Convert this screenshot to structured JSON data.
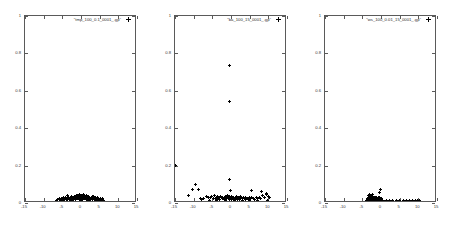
{
  "figure": {
    "background": "#ffffff",
    "marker_color": "#000000",
    "axis_color": "#5a5a5a",
    "panel_count": 3
  },
  "chart_data": [
    {
      "type": "scatter",
      "title": "\"tmp_100_0.1_0001_.gp\"",
      "legend": [
        "\"tmp_100_0.1_0001_.gp\""
      ],
      "legend_position": "top-right inside",
      "xlabel": "",
      "ylabel": "",
      "xlim": [
        -15,
        15
      ],
      "ylim": [
        0,
        1
      ],
      "xticks": [
        -15,
        -10,
        -5,
        0,
        5,
        10,
        15
      ],
      "yticks": [
        0,
        0.2,
        0.4,
        0.6,
        0.8,
        1
      ],
      "grid": false,
      "marker": "plus",
      "points": [
        [
          -6.2,
          0.018
        ],
        [
          -5.8,
          0.022
        ],
        [
          -5.5,
          0.016
        ],
        [
          -5.2,
          0.025
        ],
        [
          -5.0,
          0.019
        ],
        [
          -4.8,
          0.028
        ],
        [
          -4.6,
          0.021
        ],
        [
          -4.4,
          0.017
        ],
        [
          -4.2,
          0.03
        ],
        [
          -4.0,
          0.023
        ],
        [
          -3.9,
          0.018
        ],
        [
          -3.7,
          0.026
        ],
        [
          -3.5,
          0.02
        ],
        [
          -3.4,
          0.032
        ],
        [
          -3.2,
          0.024
        ],
        [
          -3.1,
          0.019
        ],
        [
          -2.9,
          0.028
        ],
        [
          -2.8,
          0.022
        ],
        [
          -2.6,
          0.035
        ],
        [
          -2.5,
          0.026
        ],
        [
          -2.3,
          0.02
        ],
        [
          -2.2,
          0.03
        ],
        [
          -2.0,
          0.024
        ],
        [
          -1.9,
          0.018
        ],
        [
          -1.8,
          0.033
        ],
        [
          -1.6,
          0.027
        ],
        [
          -1.5,
          0.021
        ],
        [
          -1.3,
          0.036
        ],
        [
          -1.2,
          0.029
        ],
        [
          -1.0,
          0.023
        ],
        [
          -0.9,
          0.038
        ],
        [
          -0.8,
          0.031
        ],
        [
          -0.6,
          0.025
        ],
        [
          -0.5,
          0.019
        ],
        [
          -0.4,
          0.034
        ],
        [
          -0.2,
          0.028
        ],
        [
          -0.1,
          0.022
        ],
        [
          0.0,
          0.04
        ],
        [
          0.1,
          0.032
        ],
        [
          0.3,
          0.026
        ],
        [
          0.4,
          0.02
        ],
        [
          0.6,
          0.035
        ],
        [
          0.7,
          0.029
        ],
        [
          0.9,
          0.023
        ],
        [
          1.0,
          0.038
        ],
        [
          1.2,
          0.031
        ],
        [
          1.3,
          0.025
        ],
        [
          1.5,
          0.019
        ],
        [
          1.6,
          0.033
        ],
        [
          1.8,
          0.027
        ],
        [
          1.9,
          0.021
        ],
        [
          2.1,
          0.036
        ],
        [
          2.2,
          0.03
        ],
        [
          2.4,
          0.024
        ],
        [
          2.5,
          0.018
        ],
        [
          2.7,
          0.032
        ],
        [
          2.9,
          0.026
        ],
        [
          3.0,
          0.02
        ],
        [
          3.2,
          0.034
        ],
        [
          3.4,
          0.028
        ],
        [
          3.5,
          0.022
        ],
        [
          3.7,
          0.017
        ],
        [
          3.9,
          0.03
        ],
        [
          4.1,
          0.024
        ],
        [
          4.3,
          0.019
        ],
        [
          4.5,
          0.027
        ],
        [
          4.7,
          0.021
        ],
        [
          4.9,
          0.016
        ],
        [
          5.1,
          0.025
        ],
        [
          5.4,
          0.018
        ],
        [
          5.7,
          0.022
        ],
        [
          6.0,
          0.015
        ],
        [
          -6.6,
          0.012
        ],
        [
          -2.7,
          0.014
        ],
        [
          0.2,
          0.014
        ],
        [
          2.0,
          0.013
        ],
        [
          4.0,
          0.013
        ],
        [
          5.9,
          0.011
        ],
        [
          -1.1,
          0.041
        ],
        [
          1.4,
          0.042
        ],
        [
          -3.6,
          0.038
        ],
        [
          3.3,
          0.037
        ],
        [
          -0.3,
          0.044
        ],
        [
          0.8,
          0.045
        ]
      ]
    },
    {
      "type": "scatter",
      "title": "\"ba_100_15_0001_.gp\"",
      "legend": [
        "\"ba_100_15_0001_.gp\""
      ],
      "legend_position": "top-right inside",
      "xlabel": "",
      "ylabel": "",
      "xlim": [
        -15,
        15
      ],
      "ylim": [
        0,
        1
      ],
      "xticks": [
        -15,
        -10,
        -5,
        0,
        5,
        10,
        15
      ],
      "yticks": [
        0,
        0.2,
        0.4,
        0.6,
        0.8,
        1
      ],
      "grid": false,
      "marker": "plus",
      "points": [
        [
          -0.4,
          0.735
        ],
        [
          -0.4,
          0.545
        ],
        [
          -15.0,
          0.2
        ],
        [
          -0.3,
          0.128
        ],
        [
          -9.6,
          0.1
        ],
        [
          -10.3,
          0.072
        ],
        [
          -8.6,
          0.07
        ],
        [
          -0.2,
          0.068
        ],
        [
          -11.5,
          0.04
        ],
        [
          5.4,
          0.065
        ],
        [
          8.2,
          0.06
        ],
        [
          9.6,
          0.05
        ],
        [
          -6.6,
          0.035
        ],
        [
          -6.0,
          0.03
        ],
        [
          -5.5,
          0.028
        ],
        [
          -5.1,
          0.033
        ],
        [
          -4.8,
          0.026
        ],
        [
          -4.5,
          0.038
        ],
        [
          -4.2,
          0.024
        ],
        [
          -4.0,
          0.03
        ],
        [
          -3.7,
          0.022
        ],
        [
          -3.5,
          0.034
        ],
        [
          -3.2,
          0.027
        ],
        [
          -3.0,
          0.02
        ],
        [
          -2.8,
          0.036
        ],
        [
          -2.6,
          0.029
        ],
        [
          -2.4,
          0.023
        ],
        [
          -2.2,
          0.032
        ],
        [
          -2.0,
          0.026
        ],
        [
          -1.8,
          0.019
        ],
        [
          -1.6,
          0.035
        ],
        [
          -1.4,
          0.028
        ],
        [
          -1.2,
          0.022
        ],
        [
          -1.0,
          0.038
        ],
        [
          -0.8,
          0.03
        ],
        [
          -0.6,
          0.024
        ],
        [
          -0.5,
          0.018
        ],
        [
          -0.35,
          0.033
        ],
        [
          -0.2,
          0.027
        ],
        [
          0.0,
          0.021
        ],
        [
          0.2,
          0.036
        ],
        [
          0.4,
          0.029
        ],
        [
          0.6,
          0.023
        ],
        [
          0.8,
          0.031
        ],
        [
          1.0,
          0.025
        ],
        [
          1.2,
          0.019
        ],
        [
          1.4,
          0.034
        ],
        [
          1.6,
          0.027
        ],
        [
          1.8,
          0.021
        ],
        [
          2.0,
          0.032
        ],
        [
          2.2,
          0.026
        ],
        [
          2.4,
          0.02
        ],
        [
          2.6,
          0.035
        ],
        [
          2.9,
          0.028
        ],
        [
          3.1,
          0.022
        ],
        [
          3.3,
          0.03
        ],
        [
          3.6,
          0.024
        ],
        [
          3.8,
          0.018
        ],
        [
          4.0,
          0.031
        ],
        [
          4.3,
          0.025
        ],
        [
          4.6,
          0.02
        ],
        [
          4.9,
          0.028
        ],
        [
          5.2,
          0.022
        ],
        [
          5.6,
          0.03
        ],
        [
          5.9,
          0.024
        ],
        [
          6.3,
          0.018
        ],
        [
          6.7,
          0.027
        ],
        [
          7.1,
          0.022
        ],
        [
          7.6,
          0.032
        ],
        [
          8.0,
          0.026
        ],
        [
          8.5,
          0.038
        ],
        [
          9.0,
          0.03
        ],
        [
          9.4,
          0.044
        ],
        [
          10.0,
          0.035
        ],
        [
          10.4,
          0.028
        ],
        [
          -7.3,
          0.025
        ],
        [
          -7.8,
          0.018
        ],
        [
          -8.2,
          0.022
        ],
        [
          -5.8,
          0.015
        ],
        [
          -3.9,
          0.014
        ],
        [
          -1.5,
          0.013
        ],
        [
          0.9,
          0.014
        ],
        [
          3.0,
          0.013
        ],
        [
          5.0,
          0.012
        ],
        [
          7.0,
          0.014
        ],
        [
          9.8,
          0.016
        ]
      ]
    },
    {
      "type": "scatter",
      "title": "\"ws_100_0.01_15_0001_.gp\"",
      "legend": [
        "\"ws_100_0.01_15_0001_.gp\""
      ],
      "legend_position": "top-right inside",
      "xlabel": "",
      "ylabel": "",
      "xlim": [
        -15,
        15
      ],
      "ylim": [
        0,
        1
      ],
      "xticks": [
        -15,
        -10,
        -5,
        0,
        5,
        10,
        15
      ],
      "yticks": [
        0,
        0.2,
        0.4,
        0.6,
        0.8,
        1
      ],
      "grid": false,
      "marker": "plus",
      "points": [
        [
          -0.2,
          0.072
        ],
        [
          -0.3,
          0.056
        ],
        [
          -3.0,
          0.048
        ],
        [
          -2.6,
          0.042
        ],
        [
          -2.2,
          0.045
        ],
        [
          -3.4,
          0.038
        ],
        [
          -2.9,
          0.034
        ],
        [
          -2.4,
          0.036
        ],
        [
          -3.2,
          0.03
        ],
        [
          -2.8,
          0.028
        ],
        [
          -2.5,
          0.032
        ],
        [
          -2.1,
          0.029
        ],
        [
          -1.9,
          0.031
        ],
        [
          -1.7,
          0.027
        ],
        [
          -1.5,
          0.03
        ],
        [
          -1.3,
          0.026
        ],
        [
          -1.1,
          0.029
        ],
        [
          -0.9,
          0.025
        ],
        [
          -0.7,
          0.028
        ],
        [
          -0.5,
          0.024
        ],
        [
          -0.35,
          0.027
        ],
        [
          -0.15,
          0.023
        ],
        [
          0.0,
          0.026
        ],
        [
          -3.6,
          0.022
        ],
        [
          -3.3,
          0.02
        ],
        [
          -3.0,
          0.021
        ],
        [
          -2.7,
          0.019
        ],
        [
          -2.45,
          0.02
        ],
        [
          -2.2,
          0.018
        ],
        [
          -2.0,
          0.02
        ],
        [
          -1.8,
          0.018
        ],
        [
          -1.6,
          0.019
        ],
        [
          -1.4,
          0.017
        ],
        [
          -1.2,
          0.019
        ],
        [
          -1.0,
          0.017
        ],
        [
          -0.8,
          0.018
        ],
        [
          -0.6,
          0.016
        ],
        [
          -0.4,
          0.018
        ],
        [
          -0.25,
          0.016
        ],
        [
          -0.1,
          0.017
        ],
        [
          0.05,
          0.016
        ],
        [
          0.2,
          0.017
        ],
        [
          -3.8,
          0.014
        ],
        [
          -3.5,
          0.013
        ],
        [
          -3.1,
          0.014
        ],
        [
          -2.75,
          0.013
        ],
        [
          -2.35,
          0.014
        ],
        [
          -2.05,
          0.013
        ],
        [
          -1.75,
          0.014
        ],
        [
          -1.45,
          0.013
        ],
        [
          -1.15,
          0.014
        ],
        [
          -0.85,
          0.013
        ],
        [
          -0.55,
          0.014
        ],
        [
          -0.3,
          0.013
        ],
        [
          0.0,
          0.014
        ],
        [
          0.3,
          0.013
        ],
        [
          0.5,
          0.014
        ],
        [
          1.4,
          0.011
        ],
        [
          2.3,
          0.011
        ],
        [
          3.2,
          0.012
        ],
        [
          4.1,
          0.011
        ],
        [
          5.0,
          0.012
        ],
        [
          5.9,
          0.011
        ],
        [
          6.8,
          0.012
        ],
        [
          7.6,
          0.011
        ],
        [
          8.4,
          0.012
        ],
        [
          9.2,
          0.011
        ],
        [
          9.9,
          0.012
        ],
        [
          10.4,
          0.011
        ],
        [
          -4.1,
          0.01
        ],
        [
          -0.05,
          0.01
        ],
        [
          1.0,
          0.01
        ]
      ]
    }
  ]
}
